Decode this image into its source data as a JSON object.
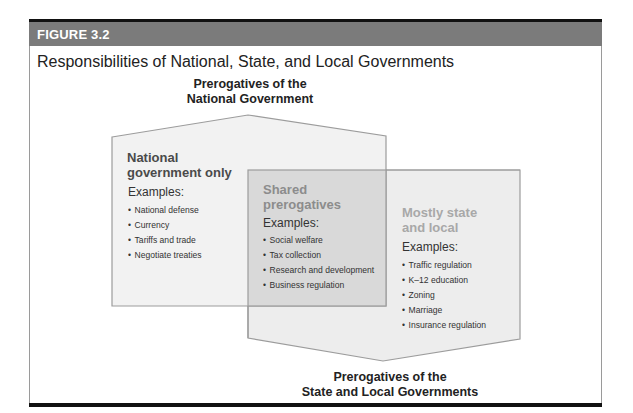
{
  "figure": {
    "label": "FIGURE 3.2",
    "title": "Responsibilities of National, State, and Local Governments"
  },
  "labels": {
    "national_line1": "Prerogatives of the",
    "national_line2": "National Government",
    "state_line1": "Prerogatives of the",
    "state_line2": "State and Local Governments"
  },
  "regions": {
    "national": {
      "title_line1": "National",
      "title_line2": "government only",
      "examples_label": "Examples:",
      "items": [
        "National defense",
        "Currency",
        "Tariffs and trade",
        "Negotiate treaties"
      ]
    },
    "shared": {
      "title_line1": "Shared",
      "title_line2": "prerogatives",
      "examples_label": "Examples:",
      "items": [
        "Social welfare",
        "Tax collection",
        "Research and development",
        "Business regulation"
      ]
    },
    "state": {
      "title_line1": "Mostly state",
      "title_line2": "and local",
      "examples_label": "Examples:",
      "items": [
        "Traffic regulation",
        "K–12 education",
        "Zoning",
        "Marriage",
        "Insurance regulation"
      ]
    }
  },
  "colors": {
    "header_band": "#7b7b7b",
    "national_fill": "#f1f1f1",
    "state_fill": "#ececec",
    "shared_fill": "#d9d9d9",
    "outline": "#9c9c9c"
  }
}
